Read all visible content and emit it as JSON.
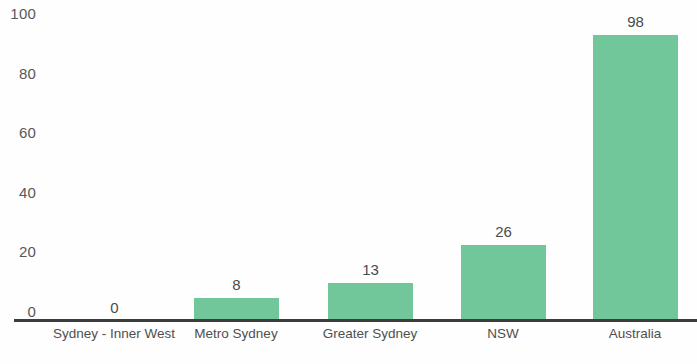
{
  "chart_data": {
    "type": "bar",
    "title": "",
    "subtitle": "",
    "xlabel": "",
    "ylabel": "",
    "categories": [
      "Sydney - Inner West",
      "Metro Sydney",
      "Greater Sydney",
      "NSW",
      "Australia"
    ],
    "values": [
      0,
      8,
      13,
      26,
      98
    ],
    "data_labels": [
      "0",
      "8",
      "13",
      "26",
      "98"
    ],
    "ylim": [
      0,
      100
    ],
    "y_ticks": [
      100,
      80,
      60,
      40,
      20,
      0
    ],
    "y_tick_labels": [
      "100",
      "80",
      "60",
      "40",
      "20",
      "0"
    ],
    "grid": false,
    "legend": null,
    "legend_position": "none",
    "bar_color": "#72c79a",
    "axis_color": "#3c3c3c",
    "tick_label_color": "#585858",
    "data_label_color": "#4a4a4a",
    "background_color": "#ffffff"
  }
}
